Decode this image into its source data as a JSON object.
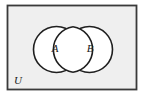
{
  "figure": {
    "type": "venn-diagram",
    "universe": {
      "label": "U",
      "label_x": 18,
      "label_y": 81.5,
      "rect": {
        "x": 7.5,
        "y": 5.5,
        "width": 129,
        "height": 84
      },
      "fill_color": "#efefef",
      "stroke_color": "#3a3a3a",
      "stroke_width": 1.8
    },
    "sets": [
      {
        "label": "A",
        "cx": 56.5,
        "cy": 49.5,
        "r": 23,
        "label_x": 55,
        "label_y": 49.5,
        "fill_color": "#ffffff",
        "stroke_color": "#1f1f1f",
        "stroke_width": 1.6
      },
      {
        "label": "B",
        "cx": 89.5,
        "cy": 49.5,
        "r": 23,
        "label_x": 90,
        "label_y": 49.5,
        "fill_color": "#ffffff",
        "stroke_color": "#1f1f1f",
        "stroke_width": 1.6
      }
    ],
    "intersection": {
      "present": true,
      "shape": "lens",
      "x_start": 66.5,
      "x_end": 79.5,
      "fill_color": "#ffffff"
    },
    "colors": {
      "page_background": "#ffffff",
      "universe_fill": "#efefef",
      "circle_fill": "#ffffff",
      "outline": "#1f1f1f",
      "text": "#1a1a1a"
    }
  }
}
